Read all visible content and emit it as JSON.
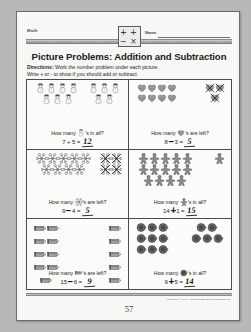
{
  "page": {
    "subject_label": "Math",
    "name_label": "Name",
    "title": "Picture Problems: Addition and Subtraction",
    "directions_prefix": "Directions:",
    "directions_line1": " Work the number problem under each picture.",
    "directions_line2": "Write + or - to show if you should add or subtract.",
    "page_number": "57",
    "copyright": "Copyright © 1991 American Education Publishing Co.",
    "header_icon": "math-symbols-icon"
  },
  "problems": [
    {
      "id": "problem-1",
      "icon": "snowman-icon",
      "question_before": "How many ",
      "question_after": "'s in all?",
      "left": 7,
      "operator": "+",
      "operator_style": "print",
      "right": 5,
      "answer": "12",
      "group_left_count": 7,
      "group_right_count": 5,
      "group_left_rows": [
        4,
        3
      ],
      "group_right_rows": [
        3,
        2
      ],
      "crossed_out": 0
    },
    {
      "id": "problem-2",
      "icon": "mitten-icon",
      "question_before": "How many ",
      "question_after": "'s are left?",
      "left": 8,
      "operator": "-",
      "operator_style": "hand",
      "right": 3,
      "answer": "5",
      "group_left_count": 8,
      "group_right_count": 3,
      "group_left_rows": [
        4,
        4
      ],
      "group_right_rows": [
        2,
        1
      ],
      "crossed_out": 3
    },
    {
      "id": "problem-3",
      "icon": "snowflake-icon",
      "question_before": "How many ",
      "question_after": "'s are left?",
      "left": 9,
      "operator": "-",
      "operator_style": "hand",
      "right": 4,
      "answer": "5",
      "group_left_count": 9,
      "group_right_count": 4,
      "group_left_rows": [
        5,
        4
      ],
      "group_right_rows": [
        2,
        2
      ],
      "crossed_out": 4
    },
    {
      "id": "problem-4",
      "icon": "gingerbread-icon",
      "question_before": "How many ",
      "question_after": "'s in all?",
      "left": 14,
      "operator": "+",
      "operator_style": "hand",
      "right": 1,
      "answer": "15",
      "group_left_count": 14,
      "group_right_count": 1,
      "group_left_rows": [
        5,
        5,
        4
      ],
      "group_right_rows": [
        1
      ],
      "crossed_out": 0
    },
    {
      "id": "problem-5",
      "icon": "pencil-icon",
      "question_before": "How many ",
      "question_after": "'s are left?",
      "left": 15,
      "operator": "-",
      "operator_style": "hand",
      "right": 6,
      "answer": "9",
      "group_left_count": 9,
      "group_right_count": 6,
      "group_left_rows": [
        2,
        2,
        2,
        2,
        1
      ],
      "group_right_rows": [
        1,
        1,
        1,
        1,
        1,
        1
      ],
      "crossed_out": 0
    },
    {
      "id": "problem-6",
      "icon": "mug-icon",
      "question_before": "How many ",
      "question_after": "'s in all?",
      "left": 9,
      "operator": "+",
      "operator_style": "hand",
      "right": 5,
      "answer": "14",
      "group_left_count": 9,
      "group_right_count": 5,
      "group_left_rows": [
        3,
        3,
        3
      ],
      "group_right_rows": [
        2,
        3
      ],
      "crossed_out": 0
    }
  ],
  "colors": {
    "paper": "#f7f7f5",
    "ink": "#1f1f1f",
    "handwriting": "#111111",
    "background": "#b8b8b8"
  }
}
